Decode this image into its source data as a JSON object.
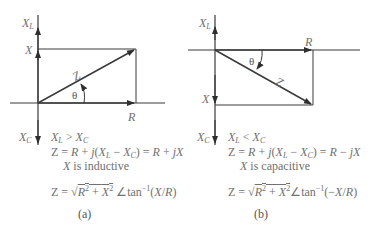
{
  "figure": {
    "panels": [
      {
        "id": "a",
        "caption": "(a)",
        "axis_labels": {
          "top": "X",
          "top_sub": "L",
          "bottom": "X",
          "bottom_sub": "C",
          "x_mark": "X",
          "r_label": "R",
          "z_label": "Z",
          "angle": "θ"
        },
        "condition": {
          "left": "X",
          "left_sub": "L",
          "op": " > ",
          "right": "X",
          "right_sub": "C"
        },
        "equation1": "Z = R + j(XL − XC) = R + jX",
        "reactance_type": "X is inductive",
        "equation2": "Z = √(R² + X²) ∠tan⁻¹(X/R)"
      },
      {
        "id": "b",
        "caption": "(b)",
        "axis_labels": {
          "top": "X",
          "top_sub": "L",
          "bottom": "X",
          "bottom_sub": "C",
          "x_mark": "X",
          "r_label": "R",
          "z_label": "Z",
          "angle": "θ"
        },
        "condition": {
          "left": "X",
          "left_sub": "L",
          "op": " < ",
          "right": "X",
          "right_sub": "C"
        },
        "equation1": "Z = R + j(XL − XC) = R − jX",
        "reactance_type": "X is capacitive",
        "equation2": "Z = √(R² + X²) ∠tan⁻¹(−X/R)"
      }
    ],
    "colors": {
      "line": "#3a3a3a",
      "text": "#6e6e6e"
    }
  }
}
